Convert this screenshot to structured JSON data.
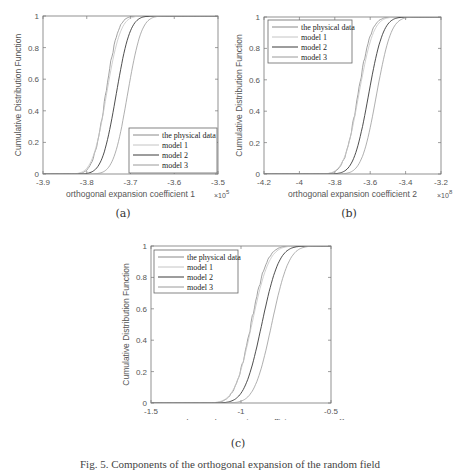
{
  "figure": {
    "caption": "Fig. 5. Components of the orthogonal expansion of the random field",
    "subfigures": [
      {
        "label": "(a)"
      },
      {
        "label": "(b)"
      },
      {
        "label": "(c)"
      }
    ]
  },
  "chart_data": [
    {
      "type": "line",
      "title": "",
      "xlabel": "orthogonal expansion coefficient 1",
      "x_exponent": "×10^5",
      "ylabel": "Cumulative Distribution Function",
      "xlim": [
        -3.9,
        -3.5
      ],
      "ylim": [
        0,
        1
      ],
      "xticks": [
        -3.9,
        -3.8,
        -3.7,
        -3.6,
        -3.5
      ],
      "yticks": [
        0,
        0.2,
        0.4,
        0.6,
        0.8,
        1
      ],
      "legend_position": "lower right",
      "series": [
        {
          "name": "the physical data",
          "color": "#8a8a8a",
          "mu": -3.757,
          "sigma": 0.022,
          "empirical": true
        },
        {
          "name": "model 1",
          "color": "#c4c4c4",
          "mu": -3.755,
          "sigma": 0.025
        },
        {
          "name": "model 2",
          "color": "#3a3a3a",
          "mu": -3.733,
          "sigma": 0.025
        },
        {
          "name": "model 3",
          "color": "#9a9a9a",
          "mu": -3.707,
          "sigma": 0.025
        }
      ]
    },
    {
      "type": "line",
      "title": "",
      "xlabel": "orthogonal expansion coefficient 2",
      "x_exponent": "×10^8",
      "ylabel": "Cumulative Distribution Function",
      "xlim": [
        -4.2,
        -3.2
      ],
      "ylim": [
        0,
        1
      ],
      "xticks": [
        -4.2,
        -4,
        -3.8,
        -3.6,
        -3.4,
        -3.2
      ],
      "yticks": [
        0,
        0.2,
        0.4,
        0.6,
        0.8,
        1
      ],
      "legend_position": "upper left",
      "series": [
        {
          "name": "the physical data",
          "color": "#8a8a8a",
          "mu": -3.67,
          "sigma": 0.06,
          "empirical": true
        },
        {
          "name": "model 1",
          "color": "#c4c4c4",
          "mu": -3.665,
          "sigma": 0.065
        },
        {
          "name": "model 2",
          "color": "#3a3a3a",
          "mu": -3.61,
          "sigma": 0.065
        },
        {
          "name": "model 3",
          "color": "#9a9a9a",
          "mu": -3.565,
          "sigma": 0.065
        }
      ]
    },
    {
      "type": "line",
      "title": "",
      "xlabel": "orthogonal expansion coefficient 3",
      "x_exponent": "×10^11",
      "ylabel": "Cumulative Distribution Function",
      "xlim": [
        -1.5,
        -0.5
      ],
      "ylim": [
        0,
        1
      ],
      "xticks": [
        -1.5,
        -1,
        -0.5
      ],
      "yticks": [
        0,
        0.2,
        0.4,
        0.6,
        0.8,
        1
      ],
      "legend_position": "upper left",
      "series": [
        {
          "name": "the physical data",
          "color": "#8a8a8a",
          "mu": -0.945,
          "sigma": 0.07,
          "empirical": true
        },
        {
          "name": "model 1",
          "color": "#c4c4c4",
          "mu": -0.94,
          "sigma": 0.075
        },
        {
          "name": "model 2",
          "color": "#3a3a3a",
          "mu": -0.885,
          "sigma": 0.075
        },
        {
          "name": "model 3",
          "color": "#9a9a9a",
          "mu": -0.83,
          "sigma": 0.075
        }
      ]
    }
  ]
}
